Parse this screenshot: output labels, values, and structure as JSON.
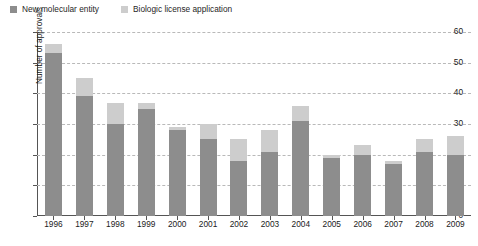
{
  "chart_data": {
    "type": "bar",
    "stacked": true,
    "title": "",
    "xlabel": "",
    "ylabel": "Number of approvals",
    "ylim": [
      0,
      60
    ],
    "yticks": [
      0,
      10,
      20,
      30,
      40,
      50,
      60
    ],
    "grid": true,
    "legend_position": "top-left",
    "categories": [
      "1996",
      "1997",
      "1998",
      "1999",
      "2000",
      "2001",
      "2002",
      "2003",
      "2004",
      "2005",
      "2006",
      "2007",
      "2008",
      "2009"
    ],
    "series": [
      {
        "name": "New molecular entity",
        "color": "#8d8d8d",
        "values": [
          53,
          39,
          30,
          35,
          28,
          25,
          18,
          21,
          31,
          19,
          20,
          17,
          21,
          20
        ]
      },
      {
        "name": "Biologic license application",
        "color": "#cdcdcd",
        "values": [
          3,
          6,
          7,
          2,
          1,
          5,
          7,
          7,
          5,
          1,
          3,
          1,
          4,
          6
        ]
      }
    ],
    "totals": [
      56,
      45,
      37,
      37,
      29,
      30,
      25,
      28,
      36,
      20,
      23,
      18,
      25,
      26
    ]
  },
  "legend": {
    "entries": [
      {
        "label": "New molecular entity",
        "color": "#8d8d8d"
      },
      {
        "label": "Biologic license application",
        "color": "#cdcdcd"
      }
    ]
  },
  "axes": {
    "y_label": "Number of approvals",
    "y_ticks": [
      "60",
      "50",
      "40",
      "30",
      "20",
      "10",
      "0"
    ],
    "x_ticks": [
      "1996",
      "1997",
      "1998",
      "1999",
      "2000",
      "2001",
      "2002",
      "2003",
      "2004",
      "2005",
      "2006",
      "2007",
      "2008",
      "2009"
    ]
  },
  "colors": {
    "primary": "#8d8d8d",
    "secondary": "#cdcdcd",
    "grid": "#b9b9b9",
    "axis": "#555555",
    "background": "#ffffff"
  }
}
